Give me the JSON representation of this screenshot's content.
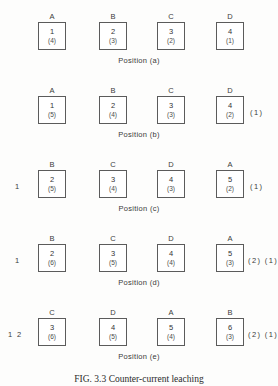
{
  "figure": {
    "caption_label": "FIG. 3.3",
    "caption_text": "Counter-current leaching",
    "position_word": "Position"
  },
  "stages": [
    {
      "id": "a",
      "caption": "Position  (a)",
      "feed_left": "",
      "feed_right": "",
      "vessels": [
        {
          "label": "A",
          "top": "1",
          "bottom": "(4)"
        },
        {
          "label": "B",
          "top": "2",
          "bottom": "(3)"
        },
        {
          "label": "C",
          "top": "3",
          "bottom": "(2)"
        },
        {
          "label": "D",
          "top": "4",
          "bottom": "(1)"
        }
      ]
    },
    {
      "id": "b",
      "caption": "Position  (b)",
      "feed_left": "",
      "feed_right": "(1)",
      "vessels": [
        {
          "label": "A",
          "top": "1",
          "bottom": "(5)"
        },
        {
          "label": "B",
          "top": "2",
          "bottom": "(4)"
        },
        {
          "label": "C",
          "top": "3",
          "bottom": "(3)"
        },
        {
          "label": "D",
          "top": "4",
          "bottom": "(2)"
        }
      ]
    },
    {
      "id": "c",
      "caption": "Position  (c)",
      "feed_left": "1",
      "feed_right": "(1)",
      "vessels": [
        {
          "label": "B",
          "top": "2",
          "bottom": "(5)"
        },
        {
          "label": "C",
          "top": "3",
          "bottom": "(4)"
        },
        {
          "label": "D",
          "top": "4",
          "bottom": "(3)"
        },
        {
          "label": "A",
          "top": "5",
          "bottom": "(2)"
        }
      ]
    },
    {
      "id": "d",
      "caption": "Position  (d)",
      "feed_left": "1",
      "feed_right": "(2) (1)",
      "vessels": [
        {
          "label": "B",
          "top": "2",
          "bottom": "(6)"
        },
        {
          "label": "C",
          "top": "3",
          "bottom": "(5)"
        },
        {
          "label": "D",
          "top": "4",
          "bottom": "(4)"
        },
        {
          "label": "A",
          "top": "5",
          "bottom": "(3)"
        }
      ]
    },
    {
      "id": "e",
      "caption": "Position  (e)",
      "feed_left": "1 2",
      "feed_right": "(2) (1)",
      "vessels": [
        {
          "label": "C",
          "top": "3",
          "bottom": "(6)"
        },
        {
          "label": "D",
          "top": "4",
          "bottom": "(5)"
        },
        {
          "label": "A",
          "top": "5",
          "bottom": "(4)"
        },
        {
          "label": "B",
          "top": "6",
          "bottom": "(3)"
        }
      ]
    }
  ]
}
